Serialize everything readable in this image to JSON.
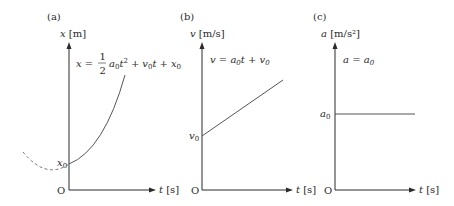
{
  "figure": {
    "panels": [
      {
        "id": "a",
        "tag": "(a)",
        "y_axis_var": "x",
        "y_axis_unit": "[m]",
        "x_axis_var": "t",
        "x_axis_unit": "[s]",
        "origin": "O",
        "intercept_label": "x",
        "intercept_sub": "0",
        "equation": "x = ½a₀t² + v₀t + x₀",
        "curve_type": "parabola (solid for t ≥ 0, dashed for t < 0)"
      },
      {
        "id": "b",
        "tag": "(b)",
        "y_axis_var": "v",
        "y_axis_unit": "[m/s]",
        "x_axis_var": "t",
        "x_axis_unit": "[s]",
        "origin": "O",
        "intercept_label": "v",
        "intercept_sub": "0",
        "equation": "v = a₀t + v₀",
        "curve_type": "straight line with positive slope"
      },
      {
        "id": "c",
        "tag": "(c)",
        "y_axis_var": "a",
        "y_axis_unit": "[m/s²]",
        "x_axis_var": "t",
        "x_axis_unit": "[s]",
        "origin": "O",
        "intercept_label": "a",
        "intercept_sub": "0",
        "equation": "a = a₀",
        "curve_type": "horizontal constant line"
      }
    ],
    "eq_parts": {
      "a_lhs": "x =",
      "a_frac_num": "1",
      "a_frac_den": "2",
      "a_term1_var": "a",
      "a_term1_sub": "0",
      "a_term1_t": "t",
      "a_term1_sup": "2",
      "a_plus1": "+",
      "a_term2_var": "v",
      "a_term2_sub": "0",
      "a_term2_t": "t",
      "a_plus2": "+",
      "a_term3_var": "x",
      "a_term3_sub": "0",
      "b_lhs": "v = a",
      "b_sub1": "0",
      "b_mid": "t + v",
      "b_sub2": "0",
      "c_lhs": "a = a",
      "c_sub": "0"
    }
  }
}
